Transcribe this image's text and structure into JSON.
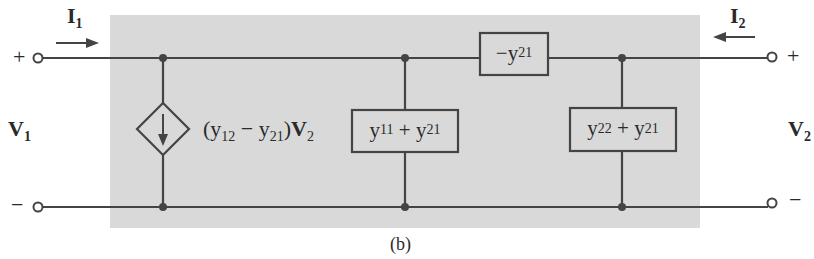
{
  "figure": {
    "caption": "(b)",
    "colors": {
      "panel": "#d9d9d9",
      "wire": "#444444",
      "ink": "#2a2a2a",
      "background": "#ffffff"
    }
  },
  "ports": {
    "left": {
      "current_label": "I",
      "current_sub": "1",
      "current_arrow": "right-arrow",
      "voltage_label": "V",
      "voltage_sub": "1",
      "plus": "+",
      "minus": "−"
    },
    "right": {
      "current_label": "I",
      "current_sub": "2",
      "current_arrow": "left-arrow",
      "voltage_label": "V",
      "voltage_sub": "2",
      "plus": "+",
      "minus": "−"
    }
  },
  "components": {
    "dependent_source": {
      "label_prefix": "(y",
      "sub1": "12",
      "mid": " − y",
      "sub2": "21",
      "suffix": ")",
      "var": "V",
      "var_sub": "2",
      "icon": "diamond-current-source-down-arrow"
    },
    "series_admittance": {
      "prefix": "−y",
      "sub": "21"
    },
    "shunt_left": {
      "a": "y",
      "a_sub": "11",
      "op": " + ",
      "b": "y",
      "b_sub": "21"
    },
    "shunt_right": {
      "a": "y",
      "a_sub": "22",
      "op": " + ",
      "b": "y",
      "b_sub": "21"
    }
  }
}
